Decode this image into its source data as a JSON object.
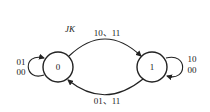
{
  "diagram": {
    "type": "state-transition",
    "input_label": "JK",
    "states": [
      {
        "id": "s0",
        "label": "0",
        "self_loop": [
          "01",
          "00"
        ]
      },
      {
        "id": "s1",
        "label": "1",
        "self_loop": [
          "10",
          "00"
        ]
      }
    ],
    "transitions": [
      {
        "from": "s0",
        "to": "s1",
        "label": "10、11"
      },
      {
        "from": "s1",
        "to": "s0",
        "label": "01、11"
      }
    ]
  }
}
